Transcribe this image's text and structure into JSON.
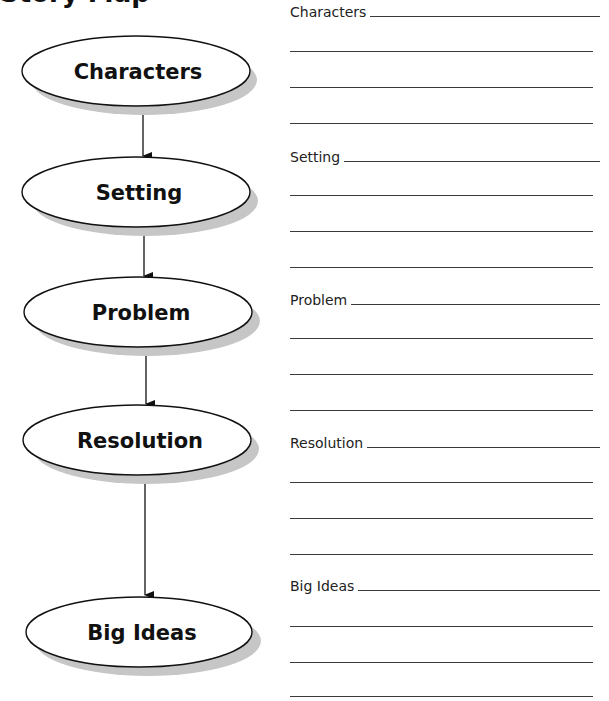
{
  "page": {
    "title": "Story Map"
  },
  "diagram": {
    "nodes": [
      {
        "id": "characters",
        "label": "Characters"
      },
      {
        "id": "setting",
        "label": "Setting"
      },
      {
        "id": "problem",
        "label": "Problem"
      },
      {
        "id": "resolution",
        "label": "Resolution"
      },
      {
        "id": "big_ideas",
        "label": "Big Ideas"
      }
    ],
    "edges": [
      {
        "from": "characters",
        "to": "setting"
      },
      {
        "from": "setting",
        "to": "problem"
      },
      {
        "from": "problem",
        "to": "resolution"
      },
      {
        "from": "resolution",
        "to": "big_ideas"
      }
    ],
    "colors": {
      "ellipse_fill": "#ffffff",
      "ellipse_stroke": "#111111",
      "shadow": "#c6c6c6",
      "arrow": "#111111"
    }
  },
  "worksheet": {
    "sections": [
      {
        "label": "Characters",
        "blank_lines": 3
      },
      {
        "label": "Setting",
        "blank_lines": 3
      },
      {
        "label": "Problem",
        "blank_lines": 3
      },
      {
        "label": "Resolution",
        "blank_lines": 3
      },
      {
        "label": "Big Ideas",
        "blank_lines": 3
      }
    ]
  }
}
